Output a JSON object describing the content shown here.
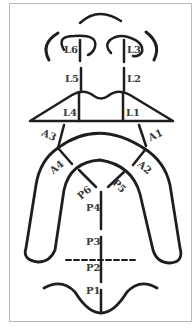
{
  "figure": {
    "colors": {
      "stroke": "#1e1e1e",
      "label": "#3a3a3a",
      "frame": "#b8b8b8",
      "background": "#ffffff"
    }
  },
  "labels": {
    "L1": "L1",
    "L2": "L2",
    "L3": "L3",
    "L4": "L4",
    "L5": "L5",
    "L6": "L6",
    "A1": "A1",
    "A2": "A2",
    "A3": "A3",
    "A4": "A4",
    "P1": "P1",
    "P2": "P2",
    "P3": "P3",
    "P4": "P4",
    "P5": "P5",
    "P6": "P6"
  }
}
